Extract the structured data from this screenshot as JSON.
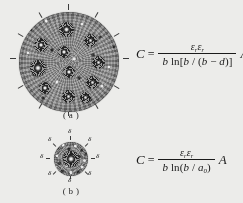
{
  "figure": {
    "background_color": "#ececea",
    "ink_color": "#1a1a1a",
    "panels": [
      {
        "id": "a",
        "caption": "( a )",
        "shape": "speckled-circle",
        "tick_count": 12,
        "rosette_count": 11,
        "label": ""
      },
      {
        "id": "b",
        "caption": "( b )",
        "shape": "speckled-circle",
        "tick_count": 8,
        "rosette_count": 1,
        "label": "δ"
      }
    ],
    "delta_labels": [
      "δ",
      "δ",
      "δ",
      "δ",
      "δ",
      "δ",
      "δ",
      "δ"
    ]
  },
  "equations": [
    {
      "id": "equation-a",
      "lhs": "C",
      "equals": "=",
      "numerator_eps1": "ε",
      "numerator_sub1": "r",
      "numerator_eps2": "ε",
      "numerator_sub2": "r",
      "denominator_b": "b",
      "denominator_ln": "ln[",
      "denominator_arg_b": "b",
      "denominator_slash": " / (",
      "denominator_arg_b2": "b",
      "denominator_minus": " − ",
      "denominator_arg_d": "d",
      "denominator_close": ")]",
      "rhs": "A",
      "plain": "C = (ε_r ε_r) / (b ln[b / (b − d)]) · A"
    },
    {
      "id": "equation-b",
      "lhs": "C",
      "equals": "=",
      "numerator_eps1": "ε",
      "numerator_sub1": "r",
      "numerator_eps2": "ε",
      "numerator_sub2": "r",
      "denominator_b": "b",
      "denominator_ln": "ln(",
      "denominator_arg_b": "b",
      "denominator_slash": " / ",
      "denominator_arg_a": "a",
      "denominator_arg_a_sub": "0",
      "denominator_close": ")",
      "rhs": "A",
      "plain": "C = (ε_r ε_r) / (b ln(b / a₀)) · A"
    }
  ]
}
